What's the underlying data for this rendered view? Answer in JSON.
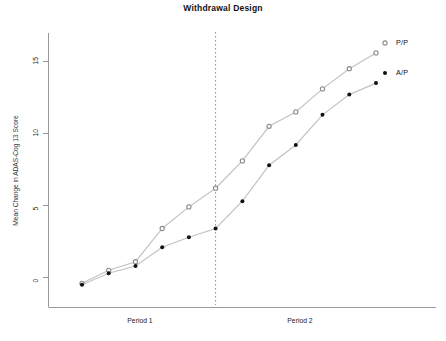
{
  "chart_data": {
    "type": "line",
    "title": "Withdrawal Design",
    "xlabel": "",
    "ylabel": "Mean Change in ADAS-Cog 13 Score",
    "ylim": [
      -2.2,
      16.8
    ],
    "yticks": [
      0,
      5,
      10,
      15
    ],
    "ytick_labels": [
      "0",
      "5",
      "10",
      "15"
    ],
    "grid": false,
    "legend_position": "right",
    "x": [
      1,
      2,
      3,
      4,
      5,
      6,
      7,
      8,
      9,
      10,
      11,
      12
    ],
    "x_group_labels": [
      "Period 1",
      "Period 2"
    ],
    "annotations": [
      {
        "type": "vertical-dashed-line",
        "x": 6,
        "label": ""
      }
    ],
    "series": [
      {
        "name": "P/P",
        "marker": "open-circle",
        "color": "#8c8c8c",
        "values": [
          -0.4,
          0.5,
          1.1,
          3.4,
          4.9,
          6.2,
          8.1,
          10.5,
          11.5,
          13.1,
          14.5,
          15.6
        ]
      },
      {
        "name": "A/P",
        "marker": "filled-circle",
        "color": "#111111",
        "values": [
          -0.5,
          0.3,
          0.8,
          2.1,
          2.8,
          3.4,
          5.3,
          7.8,
          9.2,
          11.3,
          12.7,
          13.5
        ]
      }
    ]
  },
  "axes": {
    "y_axis_label": "Mean Change in ADAS-Cog 13 Score",
    "tick_0": "0",
    "tick_5": "5",
    "tick_10": "10",
    "tick_15": "15"
  },
  "legend": {
    "pp": "P/P",
    "ap": "A/P"
  },
  "xgroups": {
    "period1": "Period 1",
    "period2": "Period 2"
  }
}
